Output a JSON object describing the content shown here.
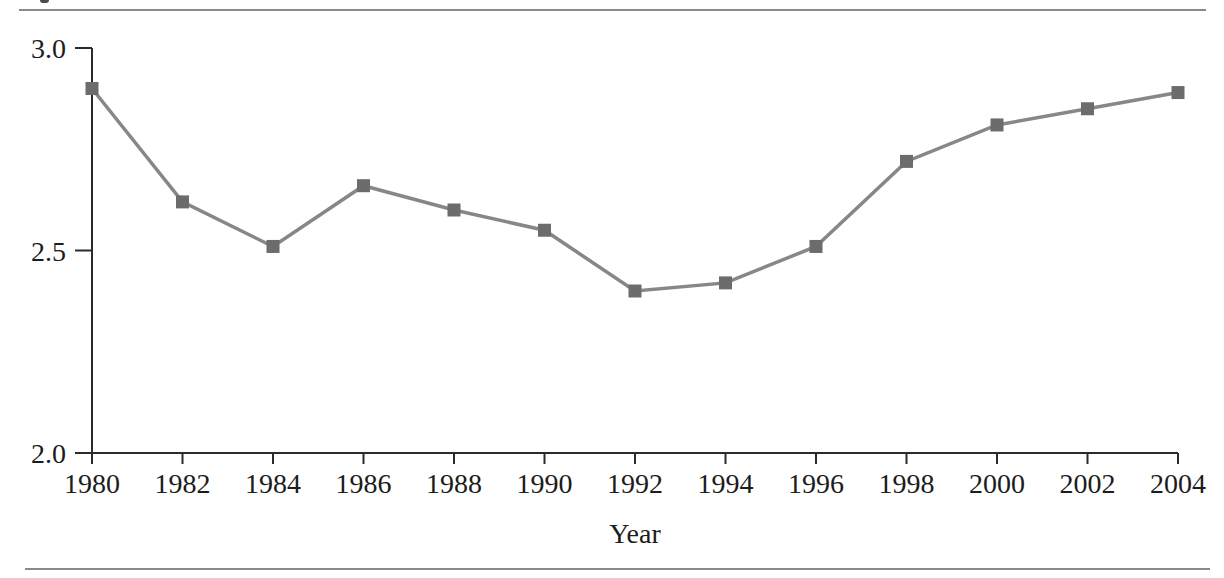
{
  "figure": {
    "top_rule": true,
    "bottom_rule": true
  },
  "chart_data": {
    "type": "line",
    "title": "",
    "xlabel": "Year",
    "ylabel": "",
    "x": [
      1980,
      1982,
      1984,
      1986,
      1988,
      1990,
      1992,
      1994,
      1996,
      1998,
      2000,
      2002,
      2004
    ],
    "values": [
      2.9,
      2.62,
      2.51,
      2.66,
      2.6,
      2.55,
      2.4,
      2.42,
      2.51,
      2.72,
      2.81,
      2.85,
      2.89
    ],
    "x_tick_labels": [
      "1980",
      "1982",
      "1984",
      "1986",
      "1988",
      "1990",
      "1992",
      "1994",
      "1996",
      "1998",
      "2000",
      "2002",
      "2004"
    ],
    "y_ticks": [
      3.0,
      2.5,
      2.0
    ],
    "y_tick_labels": [
      "3.0",
      "2.5",
      "2.0"
    ],
    "xlim": [
      1980,
      2004
    ],
    "ylim": [
      2.0,
      3.0
    ],
    "grid": false,
    "legend": null,
    "marker": "square",
    "colors": {
      "line": "#878787",
      "marker": "#6c6c6c",
      "axis": "#2b2b2b",
      "tick_text": "#1c1c1c",
      "rule": "#8a8a8a"
    }
  }
}
